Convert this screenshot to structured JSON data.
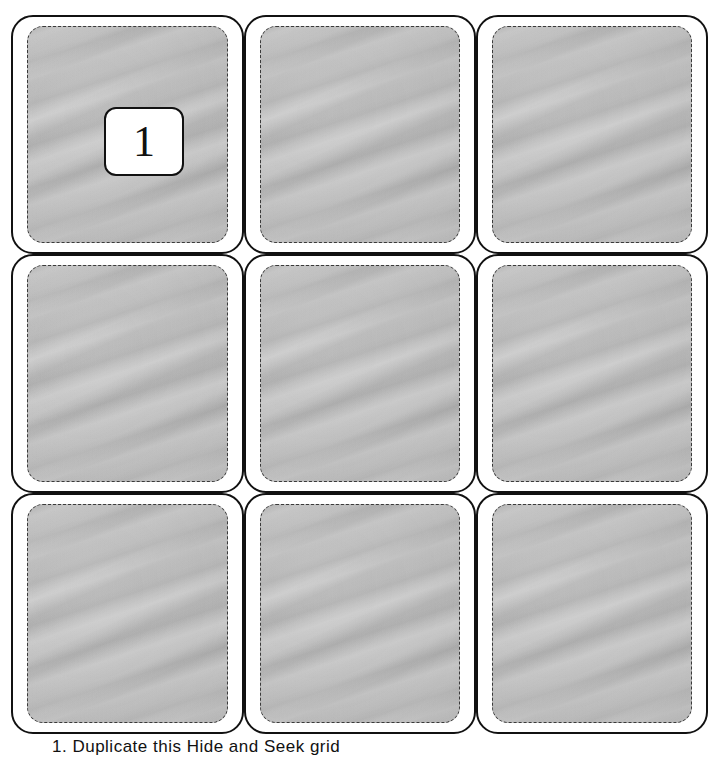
{
  "board": {
    "rows": 3,
    "cols": 3,
    "panel_color": "#bcbcbc",
    "border_color": "#111111",
    "cells": [
      {
        "row": 0,
        "col": 0,
        "label": "1"
      },
      {
        "row": 0,
        "col": 1,
        "label": ""
      },
      {
        "row": 0,
        "col": 2,
        "label": ""
      },
      {
        "row": 1,
        "col": 0,
        "label": ""
      },
      {
        "row": 1,
        "col": 1,
        "label": ""
      },
      {
        "row": 1,
        "col": 2,
        "label": ""
      },
      {
        "row": 2,
        "col": 0,
        "label": ""
      },
      {
        "row": 2,
        "col": 1,
        "label": ""
      },
      {
        "row": 2,
        "col": 2,
        "label": ""
      }
    ]
  },
  "caption": {
    "text": "1. Duplicate this Hide and Seek grid"
  }
}
